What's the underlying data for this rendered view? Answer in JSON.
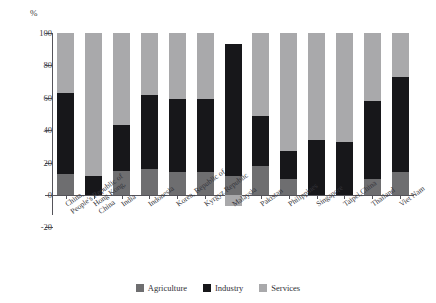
{
  "chart_data": {
    "type": "bar",
    "subtype": "stacked-bar",
    "title": "",
    "xlabel": "",
    "ylabel": "%",
    "ylim": [
      -20,
      100
    ],
    "yticks": [
      -20,
      0,
      20,
      40,
      60,
      80,
      100
    ],
    "grid": false,
    "legend_position": "bottom",
    "categories": [
      "China, People's Republic of",
      "Hong Kong, China",
      "India",
      "Indonesia",
      "Korea, Republic of",
      "Kyrgyz Republic",
      "Malaysia",
      "Pakistan",
      "Philippines",
      "Singapore",
      "Taipei,China",
      "Thailand",
      "Viet Nam"
    ],
    "category_lines": [
      [
        "China,",
        "People's Republic of"
      ],
      [
        "Hong Kong,",
        "China"
      ],
      [
        "India",
        ""
      ],
      [
        "Indonesia",
        ""
      ],
      [
        "Korea, Republic of",
        ""
      ],
      [
        "Kyrgyz Republic",
        ""
      ],
      [
        "Malaysia",
        ""
      ],
      [
        "Pakistan",
        ""
      ],
      [
        "Philippines",
        ""
      ],
      [
        "Singapore",
        ""
      ],
      [
        "Taipei,China",
        ""
      ],
      [
        "Thailand",
        ""
      ],
      [
        "Viet Nam",
        ""
      ]
    ],
    "series": [
      {
        "name": "Agriculture",
        "color": "#6e6e70",
        "values": [
          13,
          0,
          15,
          16,
          14,
          14,
          12,
          18,
          10,
          0,
          0,
          10,
          14
        ]
      },
      {
        "name": "Industry",
        "color": "#17171a",
        "values": [
          50,
          12,
          28,
          46,
          45,
          45,
          81,
          31,
          17,
          34,
          33,
          48,
          59
        ]
      },
      {
        "name": "Services",
        "color": "#a9a9ab",
        "values": [
          37,
          88,
          57,
          38,
          41,
          41,
          -7,
          51,
          73,
          66,
          67,
          42,
          27
        ]
      }
    ],
    "cumulative_tops": {
      "agriculture_top": [
        13,
        0,
        15,
        16,
        14,
        14,
        12,
        18,
        10,
        0,
        0,
        10,
        14
      ],
      "industry_top": [
        63,
        12,
        43,
        62,
        59,
        59,
        93,
        49,
        27,
        34,
        33,
        58,
        73
      ],
      "services_top": [
        100,
        100,
        100,
        100,
        100,
        100,
        93,
        100,
        100,
        100,
        100,
        100,
        100
      ],
      "services_bottom_negative": [
        0,
        0,
        0,
        0,
        0,
        0,
        -7,
        0,
        0,
        0,
        0,
        0,
        0
      ]
    }
  },
  "legend": {
    "items": [
      {
        "label": "Agriculture",
        "swatch": "agri"
      },
      {
        "label": "Industry",
        "swatch": "ind"
      },
      {
        "label": "Services",
        "swatch": "serv"
      }
    ]
  },
  "axis": {
    "y_unit": "%",
    "y_tick_labels": [
      "100",
      "80",
      "60",
      "40",
      "20",
      "0",
      "-20"
    ]
  }
}
